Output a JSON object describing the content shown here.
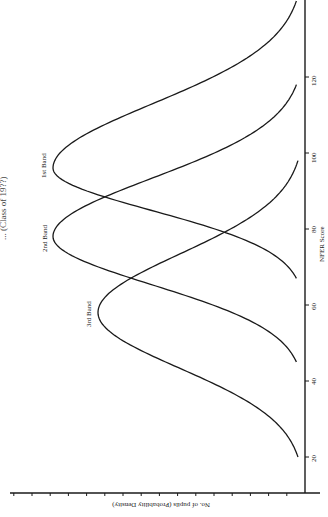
{
  "chart_data": {
    "type": "line",
    "title": "... (Class of 19??)",
    "orientation": "rotated 90° clockwise",
    "xlabel": "NFER Score",
    "ylabel": "No. of pupils (Probability Density)",
    "x_ticks": [
      20,
      40,
      60,
      80,
      100,
      120
    ],
    "xlim": [
      20,
      140
    ],
    "y_tick_count": 16,
    "grid": false,
    "legend": "inline labels at curve peaks",
    "series": [
      {
        "name": "1st Band",
        "peak_score": 96,
        "peak_density": 252,
        "left_end": 67,
        "right_end": 140
      },
      {
        "name": "2nd Band",
        "peak_score": 78,
        "peak_density": 252,
        "left_end": 45,
        "right_end": 118
      },
      {
        "name": "3rd Band",
        "peak_score": 58,
        "peak_density": 207,
        "left_end": 20,
        "right_end": 98
      }
    ]
  },
  "labels": {
    "xlabel": "NFER Score",
    "ylabel": "No. of pupils (Probability Density)",
    "title": "... (Class of 19??)",
    "band1": "1st Band",
    "band2": "2nd Band",
    "band3": "3rd Band",
    "tick20": "20",
    "tick40": "40",
    "tick60": "60",
    "tick80": "80",
    "tick100": "100",
    "tick120": "120"
  }
}
